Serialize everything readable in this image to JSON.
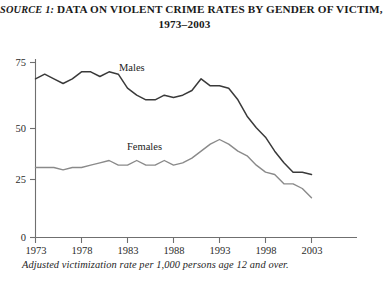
{
  "title": {
    "source_tag": "SOURCE 1:",
    "line1": "DATA ON VIOLENT CRIME RATES BY GENDER OF VICTIM,",
    "line2": "1973–2003"
  },
  "caption": "Adjusted victimization rate per 1,000 persons age 12 and over.",
  "colors": {
    "males_line": "#3a3a3a",
    "females_line": "#8a8a8a",
    "axis": "#6f6f6f",
    "text": "#1a1a1a"
  },
  "chart_data": {
    "type": "line",
    "title": "SOURCE 1: DATA ON VIOLENT CRIME RATES BY GENDER OF VICTIM, 1973–2003",
    "subtitle": "1973–2003",
    "xlabel": "",
    "ylabel": "",
    "annotation": "Adjusted victimization rate per 1,000 persons age 12 and over.",
    "grid": false,
    "legend": "inline-labels",
    "xlim": [
      1973,
      2003
    ],
    "ylim": [
      0,
      75
    ],
    "yticks": [
      0,
      25,
      50,
      75
    ],
    "ytick_labels": [
      "0",
      "25",
      "50",
      "75"
    ],
    "xticks": [
      1973,
      1978,
      1983,
      1988,
      1993,
      1998,
      2003
    ],
    "xtick_labels": [
      "1973",
      "1978",
      "1983",
      "1988",
      "1993",
      "1998",
      "2003"
    ],
    "x": [
      1973,
      1974,
      1975,
      1976,
      1977,
      1978,
      1979,
      1980,
      1981,
      1982,
      1983,
      1984,
      1985,
      1986,
      1987,
      1988,
      1989,
      1990,
      1991,
      1992,
      1993,
      1994,
      1995,
      1996,
      1997,
      1998,
      1999,
      2000,
      2001,
      2002,
      2003
    ],
    "series": [
      {
        "name": "Males",
        "color": "#3a3a3a",
        "label_x": 1982,
        "label_y": 71,
        "values": [
          68,
          70,
          68,
          66,
          68,
          71,
          71,
          69,
          71,
          70,
          64,
          61,
          59,
          59,
          61,
          60,
          61,
          63,
          68,
          65,
          65,
          64,
          59,
          52,
          47,
          43,
          37,
          32,
          28,
          28,
          27
        ]
      },
      {
        "name": "Females",
        "color": "#8a8a8a",
        "label_x": 1985,
        "label_y": 37,
        "values": [
          30,
          30,
          30,
          29,
          30,
          30,
          31,
          32,
          33,
          31,
          31,
          33,
          31,
          31,
          33,
          31,
          32,
          34,
          37,
          40,
          42,
          40,
          37,
          35,
          31,
          28,
          27,
          23,
          23,
          21,
          17
        ]
      }
    ]
  }
}
